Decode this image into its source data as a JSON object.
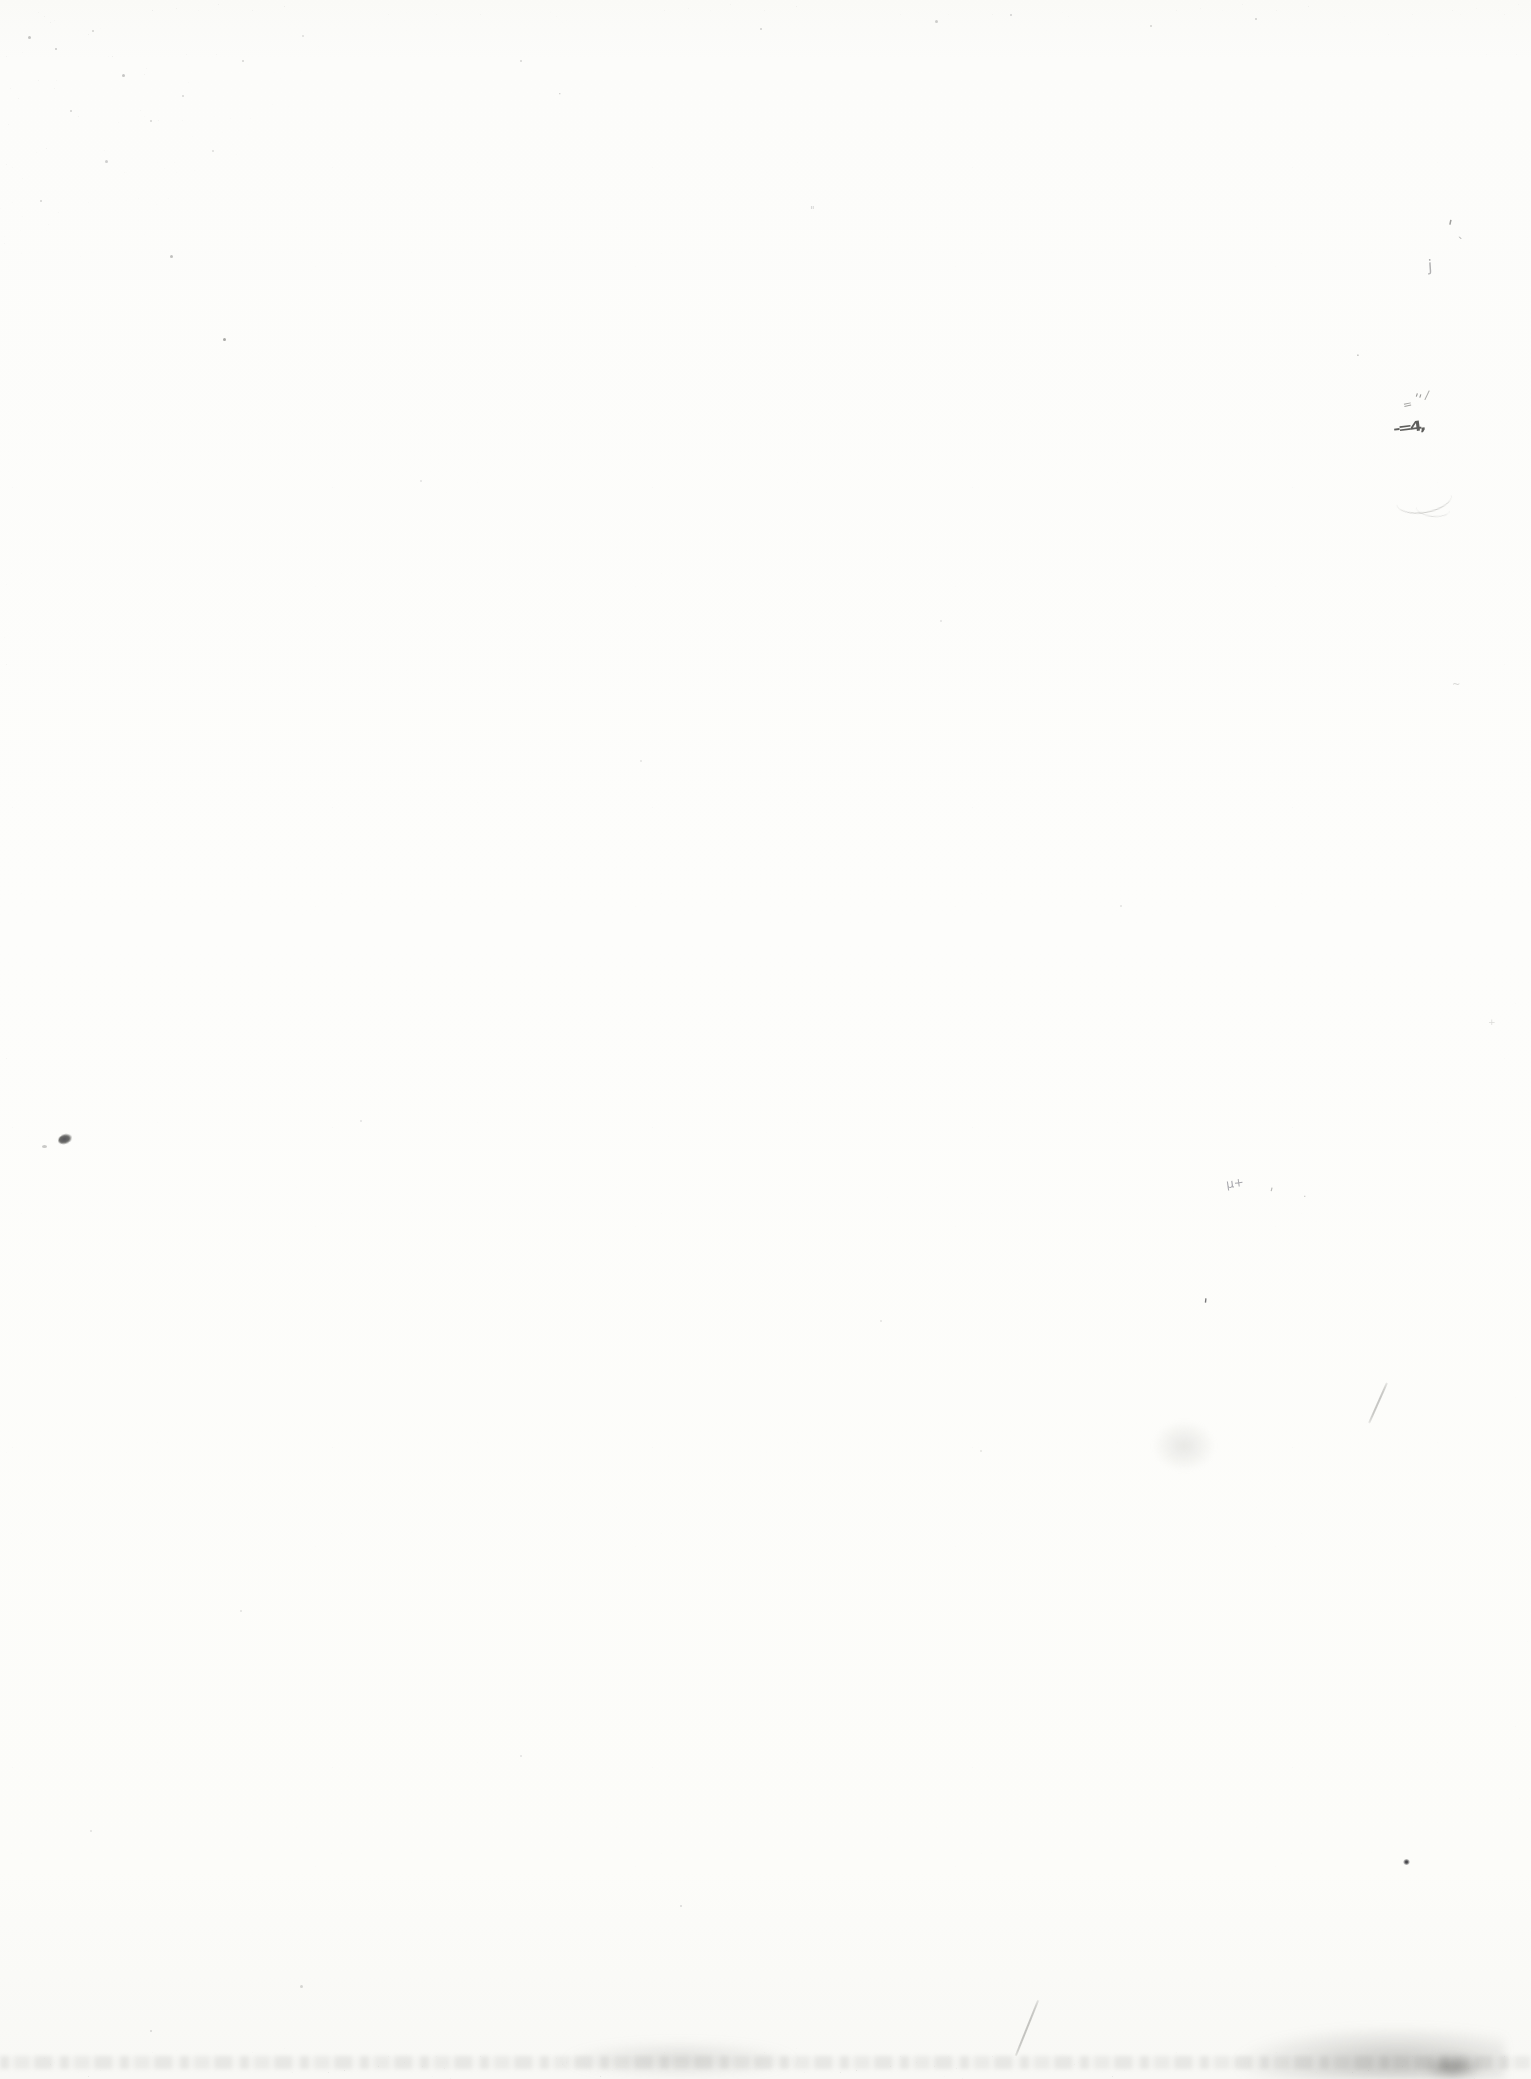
{
  "page": {
    "kind": "blank scanned book page",
    "visible_text": "",
    "paper_color": "#fcfcfa",
    "noise_color": "#6b6b69",
    "width_px": 1531,
    "height_px": 2079
  },
  "artifacts": [
    {
      "name": "pencil-apostrophe-top-right",
      "type": "glyph",
      "glyph": "'",
      "x": 1447,
      "y": 218,
      "size": 18,
      "color": "#8f8f8d",
      "rotate": 12,
      "opacity": 0.85
    },
    {
      "name": "pencil-tick-top-right",
      "type": "glyph",
      "glyph": "`",
      "x": 1458,
      "y": 236,
      "size": 13,
      "color": "#a8a8a6",
      "rotate": -6,
      "opacity": 0.8
    },
    {
      "name": "pencil-j-mark",
      "type": "glyph",
      "glyph": "j",
      "x": 1428,
      "y": 258,
      "size": 16,
      "color": "#98989a",
      "rotate": -4,
      "opacity": 0.75
    },
    {
      "name": "fleck-mid-right-1",
      "type": "glyph",
      "glyph": ".",
      "x": 1356,
      "y": 346,
      "size": 12,
      "color": "#aaaaa8",
      "opacity": 0.8
    },
    {
      "name": "pencil-equals-mark",
      "type": "glyph",
      "glyph": "=",
      "x": 1403,
      "y": 399,
      "size": 11,
      "color": "#8e8e8c",
      "rotate": -12,
      "opacity": 0.8
    },
    {
      "name": "pencil-double-tick",
      "type": "glyph",
      "glyph": "''",
      "x": 1414,
      "y": 392,
      "size": 13,
      "color": "#7f7f7d",
      "rotate": 18,
      "opacity": 0.8
    },
    {
      "name": "pencil-slash-tick",
      "type": "glyph",
      "glyph": "/",
      "x": 1425,
      "y": 389,
      "size": 12,
      "color": "#8a8a88",
      "rotate": 8,
      "opacity": 0.7
    },
    {
      "name": "pencil-scratch-dark",
      "type": "glyph",
      "glyph": "-=4,",
      "x": 1396,
      "y": 420,
      "size": 14,
      "color": "#4e4e4c",
      "rotate": -7,
      "weight": "bold",
      "spacing": -2,
      "scaleX": 1.25,
      "opacity": 0.9
    },
    {
      "name": "pencil-curve-scratch",
      "type": "arc",
      "x": 1396,
      "y": 486,
      "w": 56,
      "h": 26,
      "border": "1px solid rgba(150,150,147,0.45)",
      "radius": "50%",
      "rotate": -10,
      "blur": 0.3
    },
    {
      "name": "pencil-curve-scratch-2",
      "type": "arc",
      "x": 1416,
      "y": 500,
      "w": 34,
      "h": 16,
      "border": "1px solid rgba(165,165,162,0.35)",
      "radius": "50%",
      "rotate": 6,
      "blur": 0.3
    },
    {
      "name": "ink-blot-left",
      "type": "blob",
      "x": 58,
      "y": 1134,
      "w": 14,
      "h": 10,
      "bg": "radial-gradient(ellipse at 45% 50%, #55555a 0%, #6a6a68 45%, rgba(106,106,104,0) 78%)",
      "radius": "60% 40% 55% 45%",
      "rotate": -14,
      "blur": 0.4
    },
    {
      "name": "ink-blot-left-speck",
      "type": "blob",
      "x": 42,
      "y": 1145,
      "w": 5,
      "h": 3,
      "bg": "rgba(150,150,148,0.5)",
      "radius": "50%",
      "blur": 0.5
    },
    {
      "name": "pencil-mu-plus",
      "type": "glyph",
      "glyph": "µ+",
      "x": 1226,
      "y": 1177,
      "size": 12,
      "color": "#93939a",
      "rotate": -8,
      "opacity": 0.8
    },
    {
      "name": "pencil-comma-mid",
      "type": "glyph",
      "glyph": "'",
      "x": 1269,
      "y": 1186,
      "size": 13,
      "color": "#a2a2a0",
      "rotate": 14,
      "opacity": 0.75
    },
    {
      "name": "fleck-mid-right-2",
      "type": "glyph",
      "glyph": ".",
      "x": 1303,
      "y": 1188,
      "size": 11,
      "color": "#bdbdbb",
      "opacity": 0.8
    },
    {
      "name": "pencil-f-tick",
      "type": "glyph",
      "glyph": "'",
      "x": 1203,
      "y": 1297,
      "size": 16,
      "color": "#68686a",
      "rotate": 6,
      "opacity": 0.9
    },
    {
      "name": "scratch-diagonal-mid-right",
      "type": "line",
      "x": 1377,
      "y": 1381,
      "w": 2,
      "h": 44,
      "bg": "rgba(145,145,142,0.5)",
      "rotate": 24,
      "radius": "40%",
      "blur": 0.4
    },
    {
      "name": "smudge-mid-right",
      "type": "blob",
      "x": 1152,
      "y": 1420,
      "w": 64,
      "h": 52,
      "bg": "radial-gradient(ellipse, rgba(190,190,186,0.32) 0%, rgba(190,190,186,0) 70%)",
      "blur": 2
    },
    {
      "name": "dark-dot-lower-right",
      "type": "blob",
      "x": 1403,
      "y": 1859,
      "w": 7,
      "h": 6,
      "bg": "radial-gradient(circle, #46464a 20%, rgba(70,70,74,0) 78%)",
      "radius": "50%",
      "blur": 0.3
    },
    {
      "name": "scratch-diagonal-bottom",
      "type": "line",
      "x": 1026,
      "y": 1998,
      "w": 2,
      "h": 60,
      "bg": "rgba(130,130,127,0.45)",
      "rotate": 22,
      "radius": "40%",
      "blur": 0.5
    },
    {
      "name": "faint-mark-top-center",
      "type": "glyph",
      "glyph": "\"",
      "x": 810,
      "y": 206,
      "size": 10,
      "color": "#c8c8c6",
      "opacity": 0.8
    },
    {
      "name": "faint-mark-top-left",
      "type": "glyph",
      "glyph": "·",
      "x": 558,
      "y": 88,
      "size": 11,
      "color": "#c2c2c0",
      "opacity": 0.8
    },
    {
      "name": "faint-mark-right-1",
      "type": "glyph",
      "glyph": "~",
      "x": 1452,
      "y": 680,
      "size": 10,
      "color": "#cfcfcd",
      "opacity": 0.8
    },
    {
      "name": "faint-mark-right-2",
      "type": "glyph",
      "glyph": "+",
      "x": 1488,
      "y": 1018,
      "size": 9,
      "color": "#cdcdcb",
      "opacity": 0.7
    }
  ],
  "specks": [
    {
      "x": 28,
      "y": 36,
      "s": 3,
      "c": "#b5b5b3",
      "o": 0.8
    },
    {
      "x": 55,
      "y": 48,
      "s": 2,
      "c": "#bcbcba",
      "o": 0.8
    },
    {
      "x": 92,
      "y": 30,
      "s": 2,
      "c": "#c0c0be",
      "o": 0.7
    },
    {
      "x": 122,
      "y": 74,
      "s": 3,
      "c": "#b8b8b6",
      "o": 0.8
    },
    {
      "x": 70,
      "y": 110,
      "s": 2,
      "c": "#bfbfbd",
      "o": 0.7
    },
    {
      "x": 150,
      "y": 120,
      "s": 2,
      "c": "#c3c3c1",
      "o": 0.7
    },
    {
      "x": 105,
      "y": 160,
      "s": 3,
      "c": "#bababa",
      "o": 0.7
    },
    {
      "x": 182,
      "y": 95,
      "s": 2,
      "c": "#c4c4c2",
      "o": 0.7
    },
    {
      "x": 40,
      "y": 200,
      "s": 2,
      "c": "#c1c1bf",
      "o": 0.7
    },
    {
      "x": 212,
      "y": 150,
      "s": 2,
      "c": "#c6c6c4",
      "o": 0.6
    },
    {
      "x": 242,
      "y": 60,
      "s": 2,
      "c": "#c2c2c0",
      "o": 0.7
    },
    {
      "x": 302,
      "y": 35,
      "s": 2,
      "c": "#c7c7c5",
      "o": 0.6
    },
    {
      "x": 170,
      "y": 255,
      "s": 3,
      "c": "#b0b0ae",
      "o": 0.8
    },
    {
      "x": 223,
      "y": 338,
      "s": 3,
      "c": "#9e9e9c",
      "o": 0.9
    },
    {
      "x": 520,
      "y": 60,
      "s": 2,
      "c": "#c5c5c3",
      "o": 0.7
    },
    {
      "x": 760,
      "y": 28,
      "s": 2,
      "c": "#bdbdbb",
      "o": 0.7
    },
    {
      "x": 935,
      "y": 20,
      "s": 3,
      "c": "#b9b9b7",
      "o": 0.7
    },
    {
      "x": 1010,
      "y": 14,
      "s": 2,
      "c": "#bebebc",
      "o": 0.7
    },
    {
      "x": 1150,
      "y": 25,
      "s": 2,
      "c": "#c0c0be",
      "o": 0.7
    },
    {
      "x": 1255,
      "y": 18,
      "s": 2,
      "c": "#bbbbb9",
      "o": 0.7
    },
    {
      "x": 420,
      "y": 480,
      "s": 2,
      "c": "#d0d0ce",
      "o": 0.6
    },
    {
      "x": 640,
      "y": 760,
      "s": 2,
      "c": "#d2d2d0",
      "o": 0.6
    },
    {
      "x": 940,
      "y": 620,
      "s": 2,
      "c": "#d1d1cf",
      "o": 0.6
    },
    {
      "x": 1120,
      "y": 905,
      "s": 2,
      "c": "#cfcfcd",
      "o": 0.6
    },
    {
      "x": 360,
      "y": 1120,
      "s": 2,
      "c": "#d0d0ce",
      "o": 0.6
    },
    {
      "x": 880,
      "y": 1320,
      "s": 2,
      "c": "#d2d2d0",
      "o": 0.6
    },
    {
      "x": 980,
      "y": 1450,
      "s": 2,
      "c": "#d3d3d1",
      "o": 0.6
    },
    {
      "x": 240,
      "y": 1610,
      "s": 2,
      "c": "#cfcfcd",
      "o": 0.6
    },
    {
      "x": 520,
      "y": 1755,
      "s": 2,
      "c": "#d0d0ce",
      "o": 0.6
    },
    {
      "x": 90,
      "y": 1830,
      "s": 2,
      "c": "#cdcdcb",
      "o": 0.6
    },
    {
      "x": 680,
      "y": 1905,
      "s": 2,
      "c": "#c9c9c7",
      "o": 0.7
    },
    {
      "x": 300,
      "y": 1985,
      "s": 3,
      "c": "#c4c4c2",
      "o": 0.7
    },
    {
      "x": 150,
      "y": 2030,
      "s": 2,
      "c": "#c6c6c4",
      "o": 0.7
    }
  ]
}
